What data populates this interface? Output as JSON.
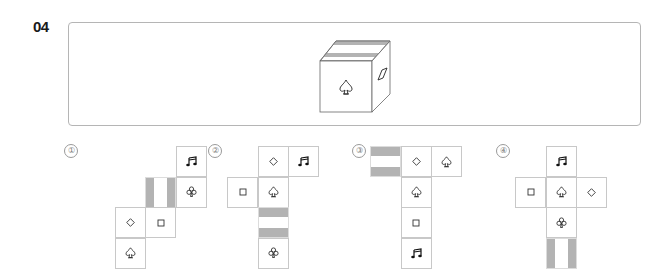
{
  "question": {
    "number": "04"
  },
  "cube": {
    "front_symbol": "spade-outline",
    "right_symbol": "parallelogram",
    "top_pattern": "two-horizontal-gray-stripes"
  },
  "options": [
    {
      "label": "①",
      "faces": [
        {
          "row": 0,
          "col": 3,
          "symbol": "music-note"
        },
        {
          "row": 1,
          "col": 2,
          "symbol": "vertical-stripes"
        },
        {
          "row": 1,
          "col": 3,
          "symbol": "club-outline"
        },
        {
          "row": 2,
          "col": 1,
          "symbol": "diamond-outline"
        },
        {
          "row": 2,
          "col": 2,
          "symbol": "square-outline"
        },
        {
          "row": 3,
          "col": 1,
          "symbol": "spade-outline"
        }
      ]
    },
    {
      "label": "②",
      "faces": [
        {
          "row": 0,
          "col": 1,
          "symbol": "diamond-outline"
        },
        {
          "row": 0,
          "col": 2,
          "symbol": "music-note"
        },
        {
          "row": 1,
          "col": 0,
          "symbol": "square-outline"
        },
        {
          "row": 1,
          "col": 1,
          "symbol": "spade-outline"
        },
        {
          "row": 2,
          "col": 1,
          "symbol": "horizontal-stripes"
        },
        {
          "row": 3,
          "col": 1,
          "symbol": "club-outline"
        }
      ]
    },
    {
      "label": "③",
      "faces": [
        {
          "row": 0,
          "col": 0,
          "symbol": "horizontal-stripes"
        },
        {
          "row": 0,
          "col": 1,
          "symbol": "diamond-outline"
        },
        {
          "row": 0,
          "col": 2,
          "symbol": "spade-outline"
        },
        {
          "row": 1,
          "col": 1,
          "symbol": "spade-outline"
        },
        {
          "row": 2,
          "col": 1,
          "symbol": "square-outline"
        },
        {
          "row": 3,
          "col": 1,
          "symbol": "music-note"
        }
      ]
    },
    {
      "label": "④",
      "faces": [
        {
          "row": 0,
          "col": 1,
          "symbol": "music-note"
        },
        {
          "row": 1,
          "col": 0,
          "symbol": "square-outline"
        },
        {
          "row": 1,
          "col": 1,
          "symbol": "spade-outline"
        },
        {
          "row": 1,
          "col": 2,
          "symbol": "diamond-outline"
        },
        {
          "row": 2,
          "col": 1,
          "symbol": "club-outline"
        },
        {
          "row": 3,
          "col": 1,
          "symbol": "vertical-stripes"
        }
      ]
    }
  ],
  "colors": {
    "stripe": "#b3b3b3",
    "border": "#c8c8c8",
    "frame": "#b5b5b5"
  }
}
